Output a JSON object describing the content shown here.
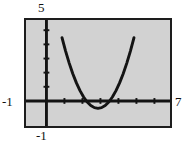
{
  "figure": {
    "background_color": "#ffffff",
    "screen_color": "#d2d2d2",
    "frame_color": "#1d1d1d",
    "curve_color": "#141414"
  },
  "labels": {
    "y_max": "5",
    "y_min": "-1",
    "x_min": "-1",
    "x_max": "7"
  },
  "chart_data": {
    "type": "line",
    "title": "",
    "xlabel": "",
    "ylabel": "",
    "xlim": [
      -1,
      7
    ],
    "ylim": [
      -1,
      5
    ],
    "grid": false,
    "legend": null,
    "x_tick_labels": [
      "-1",
      "7"
    ],
    "y_tick_labels": [
      "-1",
      "5"
    ],
    "x_ticks": [
      0,
      1,
      2,
      3,
      4,
      5,
      6,
      7
    ],
    "y_ticks": [
      0,
      1,
      2,
      3,
      4,
      5
    ],
    "tick_spacing": 1,
    "axes": {
      "x_axis_y": 0,
      "y_axis_x": 0
    },
    "annotations": [
      "Parabola vertex touches the x-axis at x = 3",
      "Curve exits the top of the window near x = 1 and x = 5"
    ],
    "series": [
      {
        "name": "y = (x - 3)^2",
        "equation": "y = (x - 3)^2",
        "vertex": [
          3,
          0
        ],
        "x": [
          1.0,
          1.2,
          1.4,
          1.6,
          1.8,
          2.0,
          2.2,
          2.4,
          2.6,
          2.8,
          3.0,
          3.2,
          3.4,
          3.6,
          3.8,
          4.0,
          4.2,
          4.4,
          4.6,
          4.8,
          5.0
        ],
        "values": [
          4.0,
          3.24,
          2.56,
          1.96,
          1.44,
          1.0,
          0.64,
          0.36,
          0.16,
          0.04,
          0.0,
          0.04,
          0.16,
          0.36,
          0.64,
          1.0,
          1.44,
          1.96,
          2.56,
          3.24,
          4.0
        ]
      }
    ]
  }
}
